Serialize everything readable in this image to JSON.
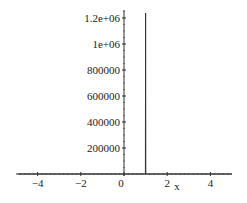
{
  "chart_data": {
    "type": "line",
    "title": "",
    "xlabel": "x",
    "ylabel": "",
    "xlim": [
      -4.9,
      5
    ],
    "ylim": [
      0,
      1250000
    ],
    "grid": false,
    "legend": null,
    "x_ticks": [
      -4,
      -2,
      0,
      2,
      4
    ],
    "x_tick_labels": [
      "−4",
      "−2",
      "0",
      "2",
      "4"
    ],
    "y_ticks": [
      200000,
      400000,
      600000,
      800000,
      1000000,
      1200000
    ],
    "y_tick_labels": [
      "200000",
      "400000",
      "600000",
      "800000",
      "1e+06",
      "1.2e+06"
    ],
    "series": [
      {
        "name": "f(x)",
        "color": "#333333",
        "description": "Near-zero everywhere except a sharp vertical spike (singularity) at x = 1 reaching above 1.2e+06",
        "x": [
          -4.9,
          0.99,
          1.0,
          1.01,
          5
        ],
        "y": [
          0,
          0,
          1250000,
          0,
          0
        ]
      }
    ]
  }
}
